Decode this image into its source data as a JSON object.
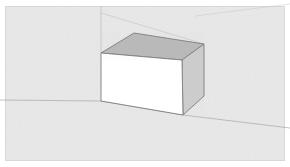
{
  "app": {
    "kind": "3d-modeling-viewport",
    "title": "3D Viewport",
    "description": "White rectangular box resting on a light gray ground plane with faint axis guide lines"
  },
  "canvas": {
    "width": 290,
    "height": 167,
    "background_color": "#ffffff",
    "ground_color": "#e9e9e9",
    "border_color": "#d8d8d8"
  },
  "axes": {
    "ground_line": {
      "name": "red-axis-ground-line",
      "color": "#9a9a9a",
      "opacity": 0.65,
      "points": "0,100 101,101 183,115 290,128"
    },
    "vertical_line": {
      "name": "blue-axis-vertical-line",
      "color": "#a8a8a8",
      "opacity": 0.55,
      "x": 101,
      "y1": 6,
      "y2": 53
    },
    "receding_line": {
      "name": "green-axis-receding-line",
      "color": "#b0b0b0",
      "opacity": 0.5,
      "points": "101,13 204,44"
    },
    "horizon_diagonal": {
      "name": "horizon-diagonal-guide",
      "color": "#c4c4c4",
      "opacity": 0.55,
      "points": "195,16 290,4"
    }
  },
  "box": {
    "name": "extruded-rectangular-box",
    "edge_color": "#7c7c7c",
    "edge_width": 0.9,
    "faces": {
      "front": {
        "name": "box-front-face",
        "fill": "#ffffff",
        "points": "101,53 182,60 183,115 101,101"
      },
      "top": {
        "name": "box-top-face",
        "fill": "#b9b9b9",
        "points": "101,53 134,33 204,44 182,60"
      },
      "right": {
        "name": "box-right-face",
        "fill": "#cdcdcd",
        "points": "182,60 204,44 204,96 183,115"
      }
    },
    "vertices": {
      "front_top_left": [
        101,
        53
      ],
      "front_top_right": [
        182,
        60
      ],
      "front_bottom_right": [
        183,
        115
      ],
      "front_bottom_left": [
        101,
        101
      ],
      "top_back_left": [
        134,
        33
      ],
      "top_back_right": [
        204,
        44
      ],
      "right_bottom_back": [
        204,
        96
      ]
    }
  },
  "icons": {
    "box_icon": "cube-icon",
    "ground_icon": "ground-plane-icon"
  }
}
